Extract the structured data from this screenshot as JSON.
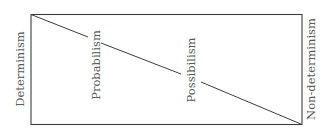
{
  "diagram": {
    "type": "spectrum-box",
    "left_label": "Determinism",
    "right_label": "Non-determinism",
    "inner_labels": [
      "Probabilism",
      "Possibilism"
    ],
    "colors": {
      "box_stroke": "#3a3f3a",
      "diagonal": "#3a3f3a",
      "text": "#555a5a"
    }
  }
}
